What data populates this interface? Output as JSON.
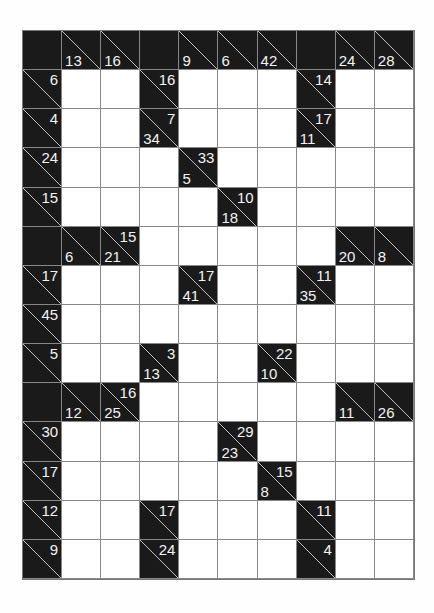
{
  "puzzle": {
    "type": "kakuro",
    "rows": 14,
    "cols": 10,
    "colors": {
      "block": "#1a1a1a",
      "empty": "#ffffff",
      "grid_line": "#888888",
      "clue_text": "#f2f2f2",
      "diagonal": "#cccccc"
    },
    "grid": [
      [
        {
          "t": "B"
        },
        {
          "t": "C",
          "d": "13"
        },
        {
          "t": "C",
          "d": "16"
        },
        {
          "t": "B"
        },
        {
          "t": "C",
          "d": "9"
        },
        {
          "t": "C",
          "d": "6"
        },
        {
          "t": "C",
          "d": "42"
        },
        {
          "t": "B"
        },
        {
          "t": "C",
          "d": "24"
        },
        {
          "t": "C",
          "d": "28"
        }
      ],
      [
        {
          "t": "C",
          "r": "6"
        },
        {
          "t": "W"
        },
        {
          "t": "W"
        },
        {
          "t": "C",
          "r": "16"
        },
        {
          "t": "W"
        },
        {
          "t": "W"
        },
        {
          "t": "W"
        },
        {
          "t": "C",
          "r": "14"
        },
        {
          "t": "W"
        },
        {
          "t": "W"
        }
      ],
      [
        {
          "t": "C",
          "r": "4"
        },
        {
          "t": "W"
        },
        {
          "t": "W"
        },
        {
          "t": "C",
          "d": "34",
          "r": "7"
        },
        {
          "t": "W"
        },
        {
          "t": "W"
        },
        {
          "t": "W"
        },
        {
          "t": "C",
          "d": "11",
          "r": "17"
        },
        {
          "t": "W"
        },
        {
          "t": "W"
        }
      ],
      [
        {
          "t": "C",
          "r": "24"
        },
        {
          "t": "W"
        },
        {
          "t": "W"
        },
        {
          "t": "W"
        },
        {
          "t": "C",
          "d": "5",
          "r": "33"
        },
        {
          "t": "W"
        },
        {
          "t": "W"
        },
        {
          "t": "W"
        },
        {
          "t": "W"
        },
        {
          "t": "W"
        }
      ],
      [
        {
          "t": "C",
          "r": "15"
        },
        {
          "t": "W"
        },
        {
          "t": "W"
        },
        {
          "t": "W"
        },
        {
          "t": "W"
        },
        {
          "t": "C",
          "d": "18",
          "r": "10"
        },
        {
          "t": "W"
        },
        {
          "t": "W"
        },
        {
          "t": "W"
        },
        {
          "t": "W"
        }
      ],
      [
        {
          "t": "B"
        },
        {
          "t": "C",
          "d": "6"
        },
        {
          "t": "C",
          "d": "21",
          "r": "15"
        },
        {
          "t": "W"
        },
        {
          "t": "W"
        },
        {
          "t": "W"
        },
        {
          "t": "W"
        },
        {
          "t": "W"
        },
        {
          "t": "C",
          "d": "20"
        },
        {
          "t": "C",
          "d": "8"
        }
      ],
      [
        {
          "t": "C",
          "r": "17"
        },
        {
          "t": "W"
        },
        {
          "t": "W"
        },
        {
          "t": "W"
        },
        {
          "t": "C",
          "d": "41",
          "r": "17"
        },
        {
          "t": "W"
        },
        {
          "t": "W"
        },
        {
          "t": "C",
          "d": "35",
          "r": "11"
        },
        {
          "t": "W"
        },
        {
          "t": "W"
        }
      ],
      [
        {
          "t": "C",
          "r": "45"
        },
        {
          "t": "W"
        },
        {
          "t": "W"
        },
        {
          "t": "W"
        },
        {
          "t": "W"
        },
        {
          "t": "W"
        },
        {
          "t": "W"
        },
        {
          "t": "W"
        },
        {
          "t": "W"
        },
        {
          "t": "W"
        }
      ],
      [
        {
          "t": "C",
          "r": "5"
        },
        {
          "t": "W"
        },
        {
          "t": "W"
        },
        {
          "t": "C",
          "d": "13",
          "r": "3"
        },
        {
          "t": "W"
        },
        {
          "t": "W"
        },
        {
          "t": "C",
          "d": "10",
          "r": "22"
        },
        {
          "t": "W"
        },
        {
          "t": "W"
        },
        {
          "t": "W"
        }
      ],
      [
        {
          "t": "B"
        },
        {
          "t": "C",
          "d": "12"
        },
        {
          "t": "C",
          "d": "25",
          "r": "16"
        },
        {
          "t": "W"
        },
        {
          "t": "W"
        },
        {
          "t": "W"
        },
        {
          "t": "W"
        },
        {
          "t": "W"
        },
        {
          "t": "C",
          "d": "11"
        },
        {
          "t": "C",
          "d": "26"
        }
      ],
      [
        {
          "t": "C",
          "r": "30"
        },
        {
          "t": "W"
        },
        {
          "t": "W"
        },
        {
          "t": "W"
        },
        {
          "t": "W"
        },
        {
          "t": "C",
          "d": "23",
          "r": "29"
        },
        {
          "t": "W"
        },
        {
          "t": "W"
        },
        {
          "t": "W"
        },
        {
          "t": "W"
        }
      ],
      [
        {
          "t": "C",
          "r": "17"
        },
        {
          "t": "W"
        },
        {
          "t": "W"
        },
        {
          "t": "W"
        },
        {
          "t": "W"
        },
        {
          "t": "W"
        },
        {
          "t": "C",
          "d": "8",
          "r": "15"
        },
        {
          "t": "W"
        },
        {
          "t": "W"
        },
        {
          "t": "W"
        }
      ],
      [
        {
          "t": "C",
          "r": "12"
        },
        {
          "t": "W"
        },
        {
          "t": "W"
        },
        {
          "t": "C",
          "r": "17"
        },
        {
          "t": "W"
        },
        {
          "t": "W"
        },
        {
          "t": "W"
        },
        {
          "t": "C",
          "r": "11"
        },
        {
          "t": "W"
        },
        {
          "t": "W"
        }
      ],
      [
        {
          "t": "C",
          "r": "9"
        },
        {
          "t": "W"
        },
        {
          "t": "W"
        },
        {
          "t": "C",
          "r": "24"
        },
        {
          "t": "W"
        },
        {
          "t": "W"
        },
        {
          "t": "W"
        },
        {
          "t": "C",
          "r": "4"
        },
        {
          "t": "W"
        },
        {
          "t": "W"
        }
      ]
    ]
  }
}
